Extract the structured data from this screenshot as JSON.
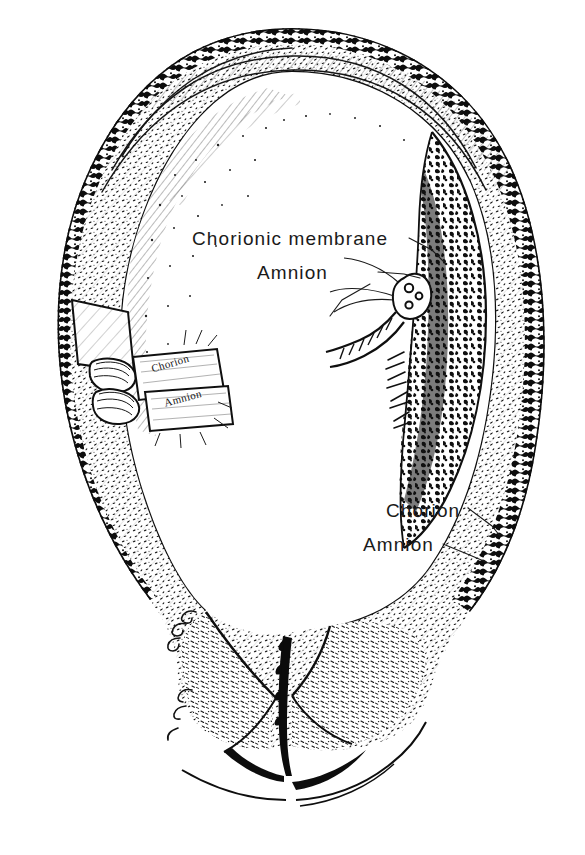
{
  "figure": {
    "medium": "pen-and-ink line drawing",
    "background_color": "#ffffff",
    "ink_color": "#111111"
  },
  "labels": {
    "chorionic_membrane": "Chorionic membrane",
    "amnion_top": "Amnion",
    "chorion_right": "Chorion",
    "amnion_right": "Amnion"
  },
  "flap_labels": {
    "chorion": "Chorion",
    "amnion": "Amnion"
  },
  "structures": [
    {
      "name": "uterine-wall",
      "description": "outer myometrium with stippled and hatched texture"
    },
    {
      "name": "placenta",
      "description": "dense mottled cotyledon mass on right wall"
    },
    {
      "name": "chorionic-membrane",
      "description": "outer fetal membrane lining the uterine cavity"
    },
    {
      "name": "amnion",
      "description": "inner fetal membrane adjacent to amniotic cavity"
    },
    {
      "name": "amniotic-cavity",
      "description": "large blank interior space"
    },
    {
      "name": "umbilical-cord-stump",
      "description": "cut cord cross-section with vessels at placental surface"
    },
    {
      "name": "membrane-flaps",
      "description": "two peeled-back rectangular flaps on left wall"
    },
    {
      "name": "cervix",
      "description": "lower segment with cervical canal"
    },
    {
      "name": "vaginal-fornix",
      "description": "tissue folds below cervix"
    }
  ]
}
